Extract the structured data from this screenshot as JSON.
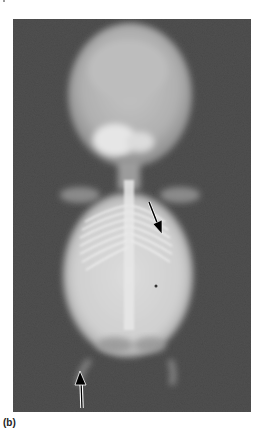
{
  "figure": {
    "panel_label": "(b)",
    "type": "radiograph",
    "background_color": "#555555",
    "arrows": [
      {
        "direction": "down-right",
        "from": [
          149,
          203
        ],
        "to": [
          161,
          232
        ]
      },
      {
        "direction": "up",
        "from": [
          82,
          408
        ],
        "to": [
          80,
          372
        ]
      }
    ]
  }
}
